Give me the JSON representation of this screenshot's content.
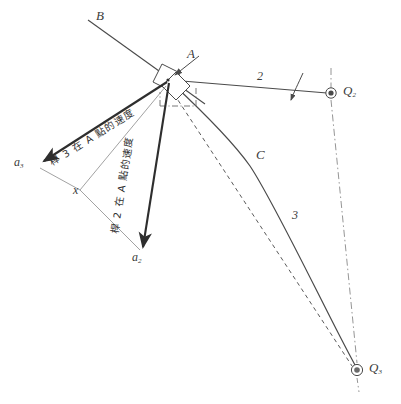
{
  "figure": {
    "type": "kinematics-velocity-diagram",
    "background": "#ffffff",
    "ink": "#3b3b3b",
    "width": 401,
    "height": 404
  },
  "labels": {
    "point_b": "B",
    "point_a": "A",
    "point_c": "C",
    "link2": "2",
    "link3": "3",
    "pivot_q2": "Q",
    "pivot_q2_sub": "2",
    "pivot_q3": "Q",
    "pivot_q3_sub": "3",
    "vector_a3": "a",
    "vector_a3_sub": "3",
    "vector_a2": "a",
    "vector_a2_sub": "2",
    "unknown_x": "x"
  },
  "annotations": {
    "velocity_of_link3_at_A": "桿 3 在 A 點的速度",
    "velocity_of_link2_at_A": "桿 2 在 A 點的速度"
  },
  "geometry": {
    "joint_A": [
      168,
      80
    ],
    "pivot_Q2": [
      331,
      93
    ],
    "pivot_Q3": [
      357,
      370
    ],
    "bend_C": [
      250,
      165
    ],
    "tip_a3": [
      38,
      163
    ],
    "tip_a2": [
      143,
      253
    ],
    "vertex_x": [
      80,
      190
    ],
    "line_B_start": [
      88,
      20
    ]
  }
}
